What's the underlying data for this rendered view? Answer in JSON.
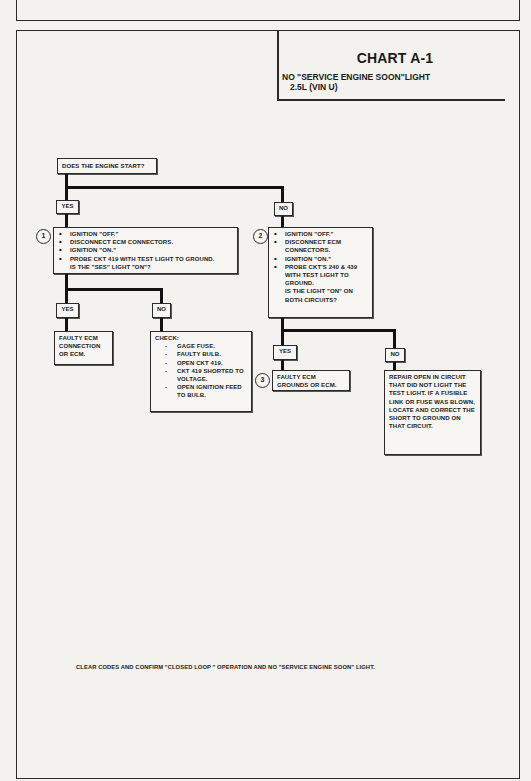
{
  "chart": {
    "title": "CHART A-1",
    "subtitle_line1": "NO \"SERVICE ENGINE SOON\"LIGHT",
    "subtitle_line2": "2.5L  (VIN U)"
  },
  "flow": {
    "start_question": "DOES THE ENGINE START?",
    "yes_label": "YES",
    "no_label": "NO",
    "step1": {
      "number": "1",
      "items": [
        "IGNITION \"OFF.\"",
        "DISCONNECT ECM CONNECTORS.",
        "IGNITION \"ON.\"",
        "PROBE CKT 419 WITH TEST LIGHT TO GROUND."
      ],
      "question": "IS THE \"SES\" LIGHT \"ON\"?"
    },
    "step2": {
      "number": "2",
      "items": [
        "IGNITION \"OFF.\"",
        "DISCONNECT ECM CONNECTORS.",
        "IGNITION \"ON.\"",
        "PROBE CKT'S 240 & 439 WITH TEST LIGHT TO GROUND."
      ],
      "question": "IS THE LIGHT \"ON\" ON BOTH CIRCUITS?"
    },
    "step1_yes_result": "FAULTY ECM CONNECTION OR ECM.",
    "step1_no_check": {
      "heading": "CHECK:",
      "items": [
        "GAGE FUSE.",
        "FAULTY BULB.",
        "OPEN CKT 419.",
        "CKT 419 SHORTED TO VOLTAGE.",
        "OPEN IGNITION FEED TO BULB."
      ]
    },
    "step3_number": "3",
    "step2_yes_result": "FAULTY ECM GROUNDS OR ECM.",
    "step2_no_result": "REPAIR OPEN IN CIRCUIT THAT DID NOT LIGHT THE TEST LIGHT.  IF A FUSIBLE LINK OR FUSE WAS BLOWN, LOCATE AND CORRECT THE SHORT TO GROUND ON THAT CIRCUIT."
  },
  "footer": {
    "note": "CLEAR CODES AND CONFIRM \"CLOSED LOOP \" OPERATION AND NO \"SERVICE ENGINE SOON\" LIGHT."
  }
}
